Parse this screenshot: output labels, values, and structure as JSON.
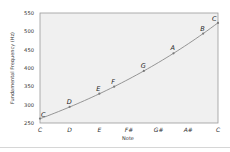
{
  "chart_data": {
    "type": "line",
    "title": "",
    "xlabel": "Note",
    "ylabel": "Fundamental Frequency (Hz)",
    "ylim": [
      250,
      550
    ],
    "yticks": [
      250,
      300,
      350,
      400,
      450,
      500,
      550
    ],
    "xticks": [
      {
        "label": "C",
        "semitone": 0
      },
      {
        "label": "D",
        "semitone": 2
      },
      {
        "label": "E",
        "semitone": 4
      },
      {
        "label": "F#",
        "semitone": 6
      },
      {
        "label": "G#",
        "semitone": 8
      },
      {
        "label": "A#",
        "semitone": 10
      },
      {
        "label": "C",
        "semitone": 12
      }
    ],
    "grid": false,
    "legend": null,
    "series": [
      {
        "name": "C major scale",
        "points": [
          {
            "note": "C",
            "semitone": 0,
            "frequency": 262
          },
          {
            "note": "D",
            "semitone": 2,
            "frequency": 294
          },
          {
            "note": "E",
            "semitone": 4,
            "frequency": 330
          },
          {
            "note": "F",
            "semitone": 5,
            "frequency": 349
          },
          {
            "note": "G",
            "semitone": 7,
            "frequency": 392
          },
          {
            "note": "A",
            "semitone": 9,
            "frequency": 440
          },
          {
            "note": "B",
            "semitone": 11,
            "frequency": 494
          },
          {
            "note": "C",
            "semitone": 12,
            "frequency": 523
          }
        ]
      }
    ],
    "colors": {
      "plot_bg": "#f0f0f0",
      "frame": "#9a9a9a",
      "line": "#8a8a8a",
      "marker": "#7a7a7a"
    }
  }
}
